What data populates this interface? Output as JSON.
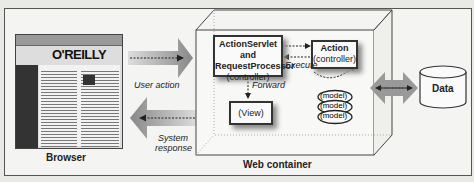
{
  "diagram": {
    "browser": {
      "label": "Browser",
      "page_logo": "O'REILLY"
    },
    "arrows": {
      "user_action": "User action",
      "system_response_line1": "System",
      "system_response_line2": "response",
      "forward": "Forward",
      "execute": "Execute"
    },
    "web_container": {
      "label": "Web container",
      "controller": {
        "line1": "ActionServlet and",
        "line2": "RequestProcessor",
        "line3": "(controller)"
      },
      "action": {
        "line1": "Action",
        "line2": "(controller)"
      },
      "view": {
        "label": "(View)"
      },
      "models": [
        "(model)",
        "(model)",
        "(model)"
      ]
    },
    "data_store": {
      "label": "Data"
    }
  }
}
